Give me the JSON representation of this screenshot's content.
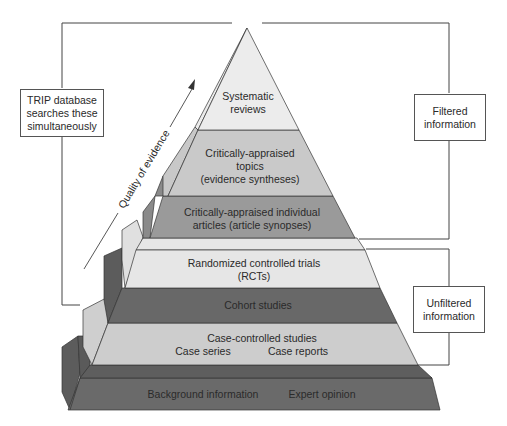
{
  "diagram": {
    "colors": {
      "light": "#e4e4e4",
      "mid": "#c8c8c8",
      "dark": "#8e8e8e",
      "darker": "#6a6a6a",
      "darkest": "#555555",
      "outline": "#333333"
    },
    "arrow_label": "Quality of evidence",
    "left_box": {
      "lines": [
        "TRIP database",
        "searches these",
        "simultaneously"
      ]
    },
    "right_boxes": [
      {
        "id": "filtered",
        "lines": [
          "Filtered",
          "information"
        ]
      },
      {
        "id": "unfiltered",
        "lines": [
          "Unfiltered",
          "information"
        ]
      }
    ],
    "levels": [
      {
        "id": "systematic-reviews",
        "lines": [
          "Systematic",
          "reviews"
        ],
        "group": "filtered"
      },
      {
        "id": "critically-appraised-topics",
        "lines": [
          "Critically-appraised",
          "topics",
          "(evidence syntheses)"
        ],
        "group": "filtered"
      },
      {
        "id": "critically-appraised-articles",
        "lines": [
          "Critically-appraised individual",
          "articles (article synopses)"
        ],
        "group": "filtered"
      },
      {
        "id": "rcts",
        "lines": [
          "Randomized controlled trials",
          "(RCTs)"
        ],
        "group": "unfiltered"
      },
      {
        "id": "cohort-studies",
        "lines": [
          "Cohort studies"
        ],
        "group": "unfiltered"
      },
      {
        "id": "case-controlled",
        "lines": [
          "Case-controlled studies"
        ],
        "sub": [
          "Case series",
          "Case reports"
        ],
        "group": "unfiltered"
      },
      {
        "id": "background",
        "lines": [],
        "sub": [
          "Background information",
          "Expert opinion"
        ],
        "group": "none"
      }
    ]
  }
}
